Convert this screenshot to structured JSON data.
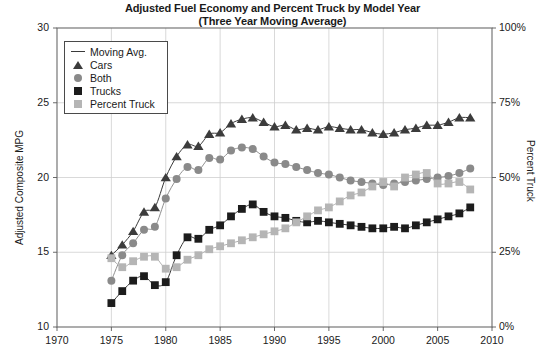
{
  "chart": {
    "title_line1": "Adjusted Fuel Economy and Percent Truck by Model Year",
    "title_line2": "(Three Year Moving Average)",
    "left_axis_title": "Adjusted Composite MPG",
    "right_axis_title": "Percent Truck",
    "left_ticks": [
      "30",
      "25",
      "20",
      "15",
      "10"
    ],
    "right_ticks": [
      "100%",
      "75%",
      "50%",
      "25%",
      "0%"
    ],
    "x_ticks": [
      "1970",
      "1975",
      "1980",
      "1985",
      "1990",
      "1995",
      "2000",
      "2005",
      "2010"
    ]
  },
  "legend": {
    "items": [
      {
        "label": "Moving Avg.",
        "marker": "line",
        "color": "#3a3a3a"
      },
      {
        "label": "Cars",
        "marker": "triangle",
        "color": "#3c3c3c"
      },
      {
        "label": "Both",
        "marker": "circle",
        "color": "#8a8a8a"
      },
      {
        "label": "Trucks",
        "marker": "square",
        "color": "#1c1c1c"
      },
      {
        "label": "Percent Truck",
        "marker": "square",
        "color": "#b5b5b5"
      }
    ]
  },
  "chart_data": {
    "type": "scatter",
    "title": "Adjusted Fuel Economy and Percent Truck by Model Year (Three Year Moving Average)",
    "xlabel": "",
    "ylabel": "Adjusted Composite MPG",
    "y2label": "Percent Truck",
    "xlim": [
      1970,
      2010
    ],
    "ylim": [
      10,
      30
    ],
    "y2lim": [
      0,
      100
    ],
    "grid": true,
    "legend_position": "upper-left",
    "x": [
      1975,
      1976,
      1977,
      1978,
      1979,
      1980,
      1981,
      1982,
      1983,
      1984,
      1985,
      1986,
      1987,
      1988,
      1989,
      1990,
      1991,
      1992,
      1993,
      1994,
      1995,
      1996,
      1997,
      1998,
      1999,
      2000,
      2001,
      2002,
      2003,
      2004,
      2005,
      2006,
      2007,
      2008
    ],
    "series": [
      {
        "name": "Cars",
        "axis": "left",
        "marker": "triangle",
        "color": "#3c3c3c",
        "values": [
          14.8,
          15.5,
          16.4,
          17.7,
          18.0,
          20.0,
          21.4,
          22.2,
          22.1,
          22.9,
          23.0,
          23.6,
          23.9,
          24.0,
          23.7,
          23.4,
          23.5,
          23.2,
          23.3,
          23.2,
          23.4,
          23.3,
          23.2,
          23.2,
          23.0,
          22.9,
          23.0,
          23.2,
          23.3,
          23.5,
          23.5,
          23.7,
          24.0,
          24.0
        ]
      },
      {
        "name": "Both",
        "axis": "left",
        "marker": "circle",
        "color": "#8a8a8a",
        "values": [
          13.1,
          14.8,
          15.6,
          16.5,
          16.7,
          18.6,
          19.9,
          20.7,
          20.5,
          21.3,
          21.2,
          21.8,
          22.0,
          21.9,
          21.4,
          21.0,
          20.9,
          20.7,
          20.5,
          20.3,
          20.2,
          20.0,
          19.8,
          19.7,
          19.6,
          19.5,
          19.6,
          19.7,
          19.8,
          19.9,
          20.0,
          20.1,
          20.3,
          20.6
        ]
      },
      {
        "name": "Trucks",
        "axis": "left",
        "marker": "square",
        "color": "#1c1c1c",
        "values": [
          11.6,
          12.4,
          13.1,
          13.4,
          12.8,
          13.0,
          14.8,
          16.0,
          15.9,
          16.5,
          16.8,
          17.4,
          17.9,
          18.2,
          17.7,
          17.4,
          17.3,
          17.1,
          17.0,
          17.1,
          17.0,
          16.9,
          16.8,
          16.7,
          16.6,
          16.6,
          16.7,
          16.6,
          16.8,
          17.0,
          17.2,
          17.4,
          17.6,
          18.0
        ]
      },
      {
        "name": "Percent Truck",
        "axis": "right",
        "marker": "square",
        "color": "#b5b5b5",
        "values": [
          23.0,
          20.0,
          22.0,
          23.5,
          23.5,
          19.5,
          20.0,
          22.5,
          24.0,
          26.0,
          27.0,
          28.0,
          29.0,
          30.0,
          31.0,
          32.0,
          33.0,
          35.0,
          37.0,
          39.0,
          40.0,
          42.0,
          44.0,
          45.0,
          47.0,
          48.5,
          47.0,
          50.0,
          51.0,
          51.5,
          48.0,
          48.0,
          48.5,
          46.0
        ]
      },
      {
        "name": "Moving Avg.",
        "axis": "left",
        "marker": "line",
        "color": "#3a3a3a",
        "note": "Three-year moving average trend lines drawn through each marker series"
      }
    ]
  }
}
